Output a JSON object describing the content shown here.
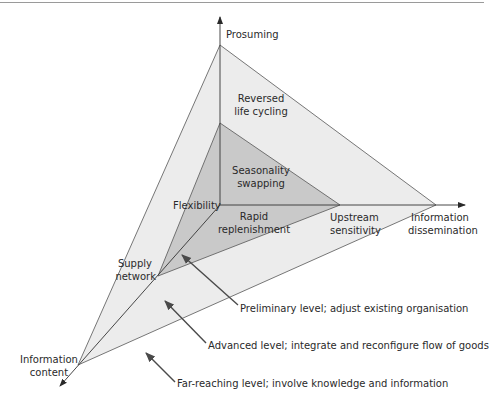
{
  "diagram": {
    "colors": {
      "outer_fill": "#ececec",
      "middle_fill": "#c9c9c9",
      "line": "#4a4a4a",
      "arrow": "#4a4a4a",
      "text": "#2a2a2a"
    },
    "axes": {
      "vertical": "Prosuming",
      "horizontal": [
        "Information",
        "dissemination"
      ],
      "diagonal": [
        "Information",
        "content"
      ]
    },
    "regions": {
      "outer_top": [
        "Reversed",
        "life cycling"
      ],
      "middle_top": [
        "Seasonality",
        "swapping"
      ],
      "middle_left": "Flexibility",
      "middle_bottom": [
        "Rapid",
        "replenishment"
      ],
      "outer_right": [
        "Upstream",
        "sensitivity"
      ],
      "outer_left": [
        "Supply",
        "network"
      ]
    },
    "levels": [
      {
        "label": "Preliminary level; adjust existing organisation"
      },
      {
        "label": "Advanced level; integrate and reconfigure flow of goods"
      },
      {
        "label": "Far-reaching level; involve knowledge and information"
      }
    ]
  }
}
